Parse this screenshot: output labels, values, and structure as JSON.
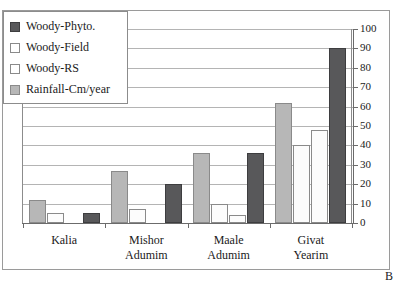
{
  "chart_data": {
    "type": "bar",
    "title": "",
    "subtitle": "",
    "xlabel": "",
    "ylabel": "",
    "ylim": [
      0,
      100
    ],
    "ytick_step": 10,
    "yticks": [
      100,
      90,
      80,
      70,
      60,
      50,
      40,
      30,
      20,
      10,
      0
    ],
    "grid": true,
    "y_axis_position": "right",
    "legend_position": "top-left",
    "panel_letter": "B",
    "categories": [
      "Kalia",
      "Mishor Adumim",
      "Maale Adumim",
      "Givat Yearim"
    ],
    "category_lines": [
      {
        "line1": "Kalia",
        "line2": ""
      },
      {
        "line1": "Mishor",
        "line2": "Adumim"
      },
      {
        "line1": "Maale",
        "line2": "Adumim"
      },
      {
        "line1": "Givat",
        "line2": "Yearim"
      }
    ],
    "series": [
      {
        "name": "Woody-Phyto.",
        "color": "#58585a",
        "style": "dark",
        "values": [
          5,
          20,
          36,
          90
        ]
      },
      {
        "name": "Woody-Field",
        "color": "#ffffff",
        "style": "light",
        "values": [
          5,
          7,
          10,
          40
        ]
      },
      {
        "name": "Woody-RS",
        "color": "#ffffff",
        "style": "light",
        "values": [
          0,
          0,
          4,
          48
        ]
      },
      {
        "name": "Rainfall-Cm/year",
        "color": "#b7b7b7",
        "style": "gray",
        "values": [
          12,
          27,
          36,
          62
        ]
      }
    ],
    "plot_order": [
      "Rainfall-Cm/year",
      "Woody-Field",
      "Woody-RS",
      "Woody-Phyto."
    ]
  },
  "legend": {
    "items": [
      {
        "label": "Woody-Phyto.",
        "swatch": "dark"
      },
      {
        "label": "Woody-Field",
        "swatch": "light"
      },
      {
        "label": "Woody-RS",
        "swatch": "light"
      },
      {
        "label": "Rainfall-Cm/year",
        "swatch": "gray"
      }
    ]
  },
  "icons": {
    "legend_swatch": "square-swatch-icon"
  }
}
